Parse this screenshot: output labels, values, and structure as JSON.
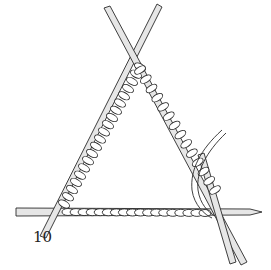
{
  "figure": {
    "label": "10",
    "colors": {
      "ink": "#2a2a2a",
      "needle": "#e6e6e6",
      "yarn": "#ffffff"
    }
  }
}
